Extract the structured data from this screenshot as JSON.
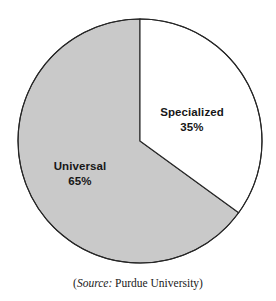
{
  "figure": {
    "background_color": "#ffffff",
    "caption": {
      "open_paren": "(",
      "source_label": "Source:",
      "source_value": " Purdue University",
      "close_paren": ")"
    }
  },
  "chart_data": {
    "type": "pie",
    "title": "",
    "subtitle": "",
    "xlabel": "",
    "ylabel": "",
    "grid": false,
    "legend_position": "none",
    "labels_inside": true,
    "start_angle_deg": 0,
    "direction": "clockwise",
    "center": {
      "x": 140,
      "y": 141
    },
    "radius": 122,
    "stroke_color": "#262626",
    "stroke_width": 1,
    "categories": [
      "Specialized",
      "Universal"
    ],
    "values": [
      35,
      65
    ],
    "units": "%",
    "slices": [
      {
        "name": "Specialized",
        "value": 35,
        "value_label": "35%",
        "color": "#ffffff",
        "angle_deg": 126,
        "start_deg": 0,
        "end_deg": 126
      },
      {
        "name": "Universal",
        "value": 65,
        "value_label": "65%",
        "color": "#c9c9c9",
        "angle_deg": 234,
        "start_deg": 126,
        "end_deg": 360
      }
    ]
  }
}
